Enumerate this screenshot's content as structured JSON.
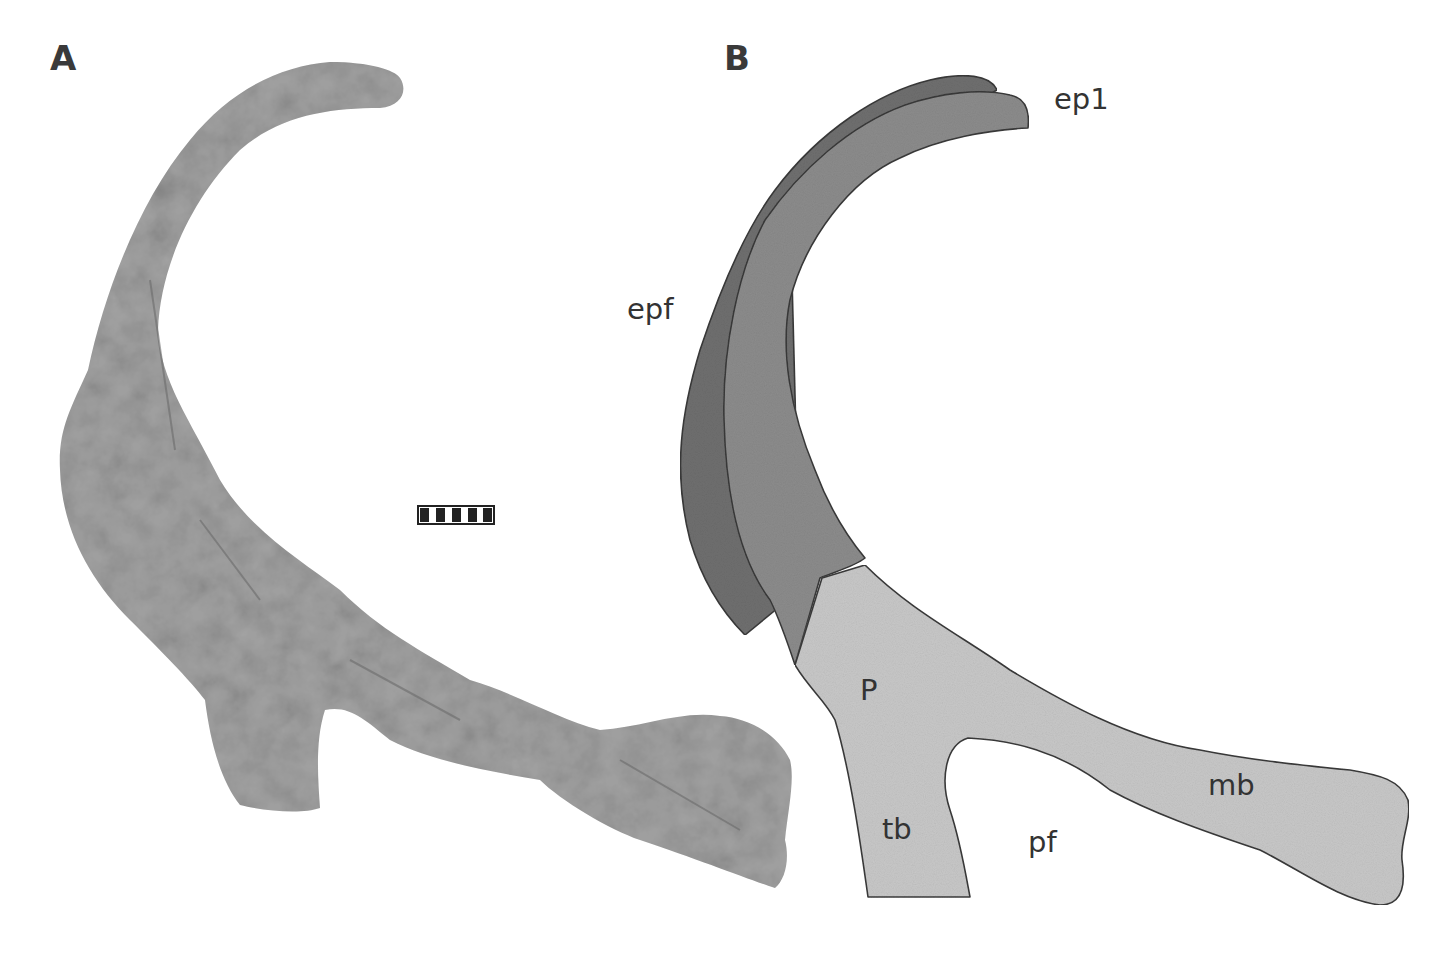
{
  "figure": {
    "panels": [
      {
        "id": "A",
        "letter": "A",
        "content": "specimen-photograph"
      },
      {
        "id": "B",
        "letter": "B",
        "content": "interpretive-line-drawing"
      }
    ],
    "scale_bar": {
      "segments": 5,
      "pattern": "alternating black/white"
    },
    "labels": {
      "ep1": "ep1",
      "epf": "epf",
      "P": "P",
      "tb": "tb",
      "pf": "pf",
      "mb": "mb"
    },
    "colors": {
      "background": "#ffffff",
      "epf_dark": "#6f6f6f",
      "ep1_mid": "#8c8c8c",
      "P_light": "#c8c8c8",
      "outline": "#3a3a3a",
      "photo_bone": "#9a9a9a"
    }
  }
}
